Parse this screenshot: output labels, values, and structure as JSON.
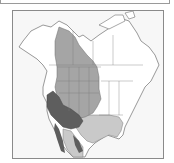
{
  "map": {
    "subject": "North America species range map",
    "regions": [
      {
        "name": "range-light",
        "color": "#c9c9c9"
      },
      {
        "name": "range-medium",
        "color": "#a5a5a5"
      },
      {
        "name": "range-dark",
        "color": "#5e5e5e"
      }
    ],
    "colors": {
      "land": "#ffffff",
      "border": "#6f6f6f",
      "background": "#f7f7f7",
      "frame": "#8a8a8a"
    }
  }
}
